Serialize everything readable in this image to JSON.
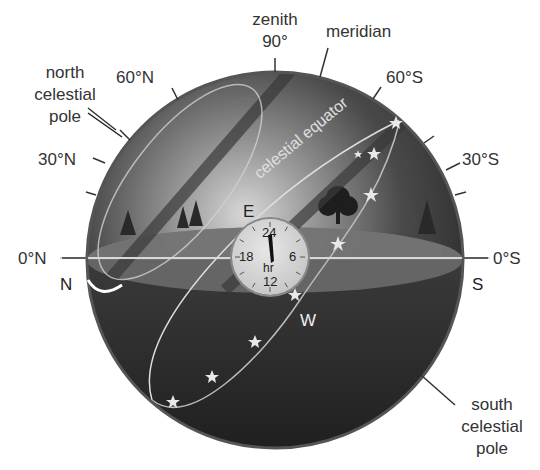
{
  "diagram": {
    "labels": {
      "zenith": "zenith",
      "zenith_angle": "90°",
      "meridian": "meridian",
      "north_celestial_pole": [
        "north",
        "celestial",
        "pole"
      ],
      "south_celestial_pole": [
        "south",
        "celestial",
        "pole"
      ],
      "celestial_equator": "celestial equator"
    },
    "altitude_ticks": {
      "north": [
        "60°N",
        "30°N",
        "0°N"
      ],
      "south": [
        "60°S",
        "30°S",
        "0°S"
      ]
    },
    "directions": {
      "north": "N",
      "south": "S",
      "east": "E",
      "west": "W"
    },
    "clock": {
      "top": "24",
      "right": "6",
      "bottom": "12",
      "left": "18",
      "unit": "hr"
    },
    "colors": {
      "sphere_dark": "#2b2b2b",
      "sphere_light": "#cfcfcf",
      "ground": "#6e6e6e",
      "star": "#e8e8e8",
      "label_text": "#333333"
    }
  }
}
